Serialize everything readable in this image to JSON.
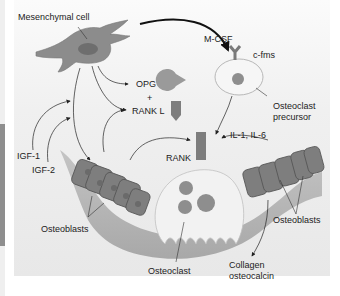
{
  "diagram": {
    "labels": {
      "mesenchymal_cell": "Mesenchymal cell",
      "m_csf": "M-CSF",
      "c_fms": "c-fms",
      "opg": "OPG",
      "plus": "+",
      "rank_l": "RANK L",
      "osteoclast_precursor_line1": "Osteoclast",
      "osteoclast_precursor_line2": "precursor",
      "igf1": "IGF-1",
      "igf2": "IGF-2",
      "rank": "RANK",
      "il": "IL-1, IL-6",
      "osteoblasts_left": "Osteoblasts",
      "osteoblasts_right": "Osteoblasts",
      "osteoclast": "Osteoclast",
      "collagen_line1": "Collagen",
      "collagen_line2": "osteocalcin"
    },
    "nodes": [
      {
        "id": "mesenchymal-cell",
        "label": "Mesenchymal cell"
      },
      {
        "id": "osteoclast-precursor",
        "label": "Osteoclast precursor"
      },
      {
        "id": "osteoblasts-left",
        "label": "Osteoblasts"
      },
      {
        "id": "osteoblasts-right",
        "label": "Osteoblasts"
      },
      {
        "id": "osteoclast",
        "label": "Osteoclast"
      },
      {
        "id": "opg",
        "label": "OPG"
      },
      {
        "id": "rank-l",
        "label": "RANK L"
      },
      {
        "id": "rank",
        "label": "RANK"
      },
      {
        "id": "c-fms",
        "label": "c-fms"
      }
    ],
    "edges": [
      {
        "from": "mesenchymal-cell",
        "to": "osteoclast-precursor",
        "label": "M-CSF"
      },
      {
        "from": "mesenchymal-cell",
        "to": "opg"
      },
      {
        "from": "mesenchymal-cell",
        "to": "rank-l"
      },
      {
        "from": "mesenchymal-cell",
        "to": "osteoblasts-left"
      },
      {
        "from": "IGF-1",
        "to": "mesenchymal-cell"
      },
      {
        "from": "IGF-2",
        "to": "mesenchymal-cell"
      },
      {
        "from": "osteoblasts-left",
        "to": "rank-l"
      },
      {
        "from": "osteoblasts-left",
        "to": "rank"
      },
      {
        "from": "osteoclast-precursor",
        "to": "osteoclast"
      },
      {
        "from": "IL-1, IL-6",
        "to": "osteoclast"
      },
      {
        "from": "osteoblasts-right",
        "to": "collagen-osteocalcin"
      }
    ],
    "colors": {
      "cell_fill": "#8a8a8a",
      "cell_dark": "#6e6e6e",
      "precursor_fill": "#f4f4f4",
      "bone_fill": "#b5b5b5",
      "receptor": "#7a7a7a"
    }
  }
}
